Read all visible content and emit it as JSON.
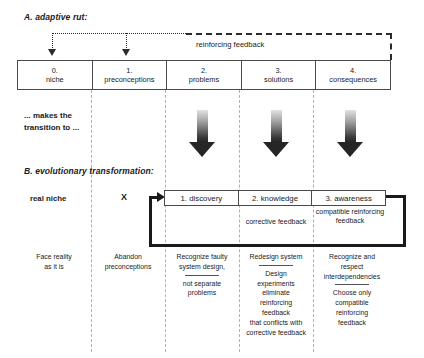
{
  "sections": {
    "a": {
      "title": "A. adaptive rut:"
    },
    "b": {
      "title": "B. evolutionary transformation:"
    }
  },
  "transition": {
    "line1": "... makes the",
    "line2": "transition to ..."
  },
  "feedback_top": {
    "label": "reinforcing feedback"
  },
  "stages": [
    {
      "num": "0.",
      "label": "niche"
    },
    {
      "num": "1.",
      "label": "preconceptions"
    },
    {
      "num": "2.",
      "label": "problems"
    },
    {
      "num": "3.",
      "label": "solutions"
    },
    {
      "num": "4.",
      "label": "consequences"
    }
  ],
  "row_labels": {
    "real_niche": "real niche",
    "x_mark": "X"
  },
  "phases": [
    {
      "label": "1. discovery"
    },
    {
      "label": "2. knowledge"
    },
    {
      "label": "3. awareness"
    }
  ],
  "feedback_notes": {
    "corrective": "corrective feedback",
    "compatible_line1": "compatible",
    "compatible_line2": "reinforcing",
    "compatible_line3": "feedback"
  },
  "actions": [
    {
      "top": "Face reality\nas it is",
      "bottom": ""
    },
    {
      "top": "Abandon\npreconceptions",
      "bottom": ""
    },
    {
      "top": "Recognize faulty\nsystem design,",
      "bottom": "not separate\nproblems"
    },
    {
      "top": "Redesign system",
      "bottom": "Design\nexperiments\neliminate\nreinforcing\nfeedback\nthat conflicts with\ncorrective feedback"
    },
    {
      "top": "Recognize and\nrespect\ninterdependencies",
      "bottom": "Choose only\ncompatible\nreinforcing\nfeedback"
    }
  ],
  "colors": {
    "ink": "#1a1a1a",
    "border": "#4a4a4a",
    "separator": "#b0b0b0",
    "arrow_dark": "#262626"
  }
}
